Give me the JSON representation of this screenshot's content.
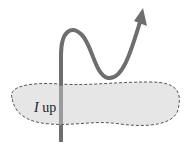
{
  "diagram": {
    "label_symbol": "I",
    "label_text": "up",
    "colors": {
      "surface_fill": "#e6e6e6",
      "surface_border": "#555555",
      "wire": "#6e6e6e",
      "wire_inside": "#9a9a9a"
    }
  }
}
